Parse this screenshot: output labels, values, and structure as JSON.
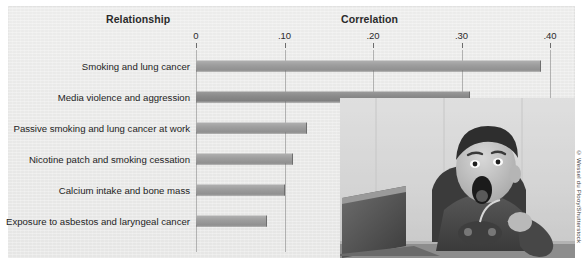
{
  "figure": {
    "column_header_left": "Relationship",
    "column_header_right": "Correlation",
    "credit": "© Wessel du Plooy/Shutterstock"
  },
  "chart_data": {
    "type": "bar",
    "orientation": "horizontal",
    "title": "",
    "xlabel": "Correlation",
    "ylabel": "Relationship",
    "xlim": [
      0,
      0.4
    ],
    "grid": true,
    "legend": "none",
    "tick_labels": [
      "0",
      ".10",
      ".20",
      ".30",
      ".40"
    ],
    "tick_values": [
      0,
      0.1,
      0.2,
      0.3,
      0.4
    ],
    "categories": [
      "Smoking and lung cancer",
      "Media violence and aggression",
      "Passive smoking and lung cancer at work",
      "Nicotine patch and smoking cessation",
      "Calcium intake and bone mass",
      "Exposure to asbestos and laryngeal cancer"
    ],
    "values": [
      0.39,
      0.31,
      0.125,
      0.11,
      0.1,
      0.08
    ],
    "series": [
      {
        "name": "Correlation",
        "values": [
          0.39,
          0.31,
          0.125,
          0.11,
          0.1,
          0.08
        ]
      }
    ],
    "bar_colors": [
      "#a0a0a0",
      "#8a8a8a",
      "#a0a0a0",
      "#a0a0a0",
      "#a0a0a0",
      "#a0a0a0"
    ]
  },
  "photo": {
    "alt": "Boy reacting with surprise in front of a computer while holding a game controller"
  }
}
